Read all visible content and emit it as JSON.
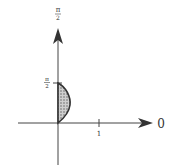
{
  "diagram": {
    "type": "polar-region-sketch",
    "axes": {
      "vertical": {
        "label_top": {
          "num": "π",
          "den": "2"
        },
        "tick_label": {
          "num": "π",
          "den": "2"
        }
      },
      "horizontal": {
        "end_label": "0",
        "tick_label": "1"
      }
    },
    "region": {
      "description": "shaded crescent between the vertical axis and a curve, from origin to the π/2 tick",
      "fill": "crosshatch"
    },
    "colors": {
      "ink": "#333333",
      "background": "#ffffff",
      "shade": "#777777"
    }
  }
}
